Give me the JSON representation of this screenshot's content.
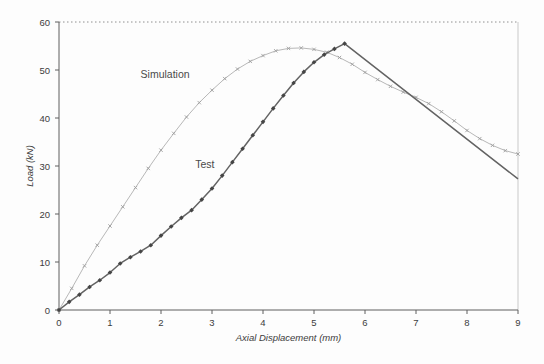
{
  "chart_data": {
    "type": "line",
    "title": "",
    "xlabel": "Axial Displacement (mm)",
    "ylabel": "Load (kN)",
    "xlim": [
      0,
      9
    ],
    "ylim": [
      0,
      60
    ],
    "xticks": [
      0,
      1,
      2,
      3,
      4,
      5,
      6,
      7,
      8,
      9
    ],
    "yticks": [
      0,
      10,
      20,
      30,
      40,
      50,
      60
    ],
    "grid": "single dotted gridline at y=60 (top frame); light solid right frame border",
    "legend_position": "none (inline text annotations)",
    "colors": {
      "axis": "#5f5f5f",
      "tick_text": "#3c3c3c",
      "top_gridline": "#909090",
      "right_border": "#c9c9c9",
      "simulation_line": "#b8b8b8",
      "simulation_marker": "#9e9e9e",
      "test_line": "#636363",
      "test_marker": "#454545",
      "annotation_text": "#4a4a4a"
    },
    "series": [
      {
        "name": "Simulation",
        "marker": "x",
        "markers_through_x": 9,
        "x": [
          0,
          0.25,
          0.5,
          0.75,
          1,
          1.25,
          1.5,
          1.75,
          2,
          2.25,
          2.5,
          2.75,
          3,
          3.25,
          3.5,
          3.75,
          4,
          4.25,
          4.5,
          4.75,
          5,
          5.25,
          5.5,
          5.75,
          6,
          6.25,
          6.5,
          6.75,
          7,
          7.25,
          7.5,
          7.75,
          8,
          8.25,
          8.5,
          8.75,
          9
        ],
        "y": [
          0,
          4.5,
          9.2,
          13.5,
          17.5,
          21.5,
          25.5,
          29.5,
          33.3,
          36.8,
          40.2,
          43.2,
          45.8,
          48.2,
          50.2,
          51.8,
          53,
          54,
          54.5,
          54.6,
          54.3,
          53.7,
          52.6,
          51.2,
          49.5,
          48,
          46.6,
          45.4,
          44.3,
          43,
          41.3,
          39.4,
          37.4,
          35.7,
          34.3,
          33.2,
          32.5
        ]
      },
      {
        "name": "Test",
        "marker": "diamond",
        "markers_through_x": 5.65,
        "x": [
          0,
          0.2,
          0.4,
          0.6,
          0.8,
          1,
          1.2,
          1.4,
          1.6,
          1.8,
          2,
          2.2,
          2.4,
          2.6,
          2.8,
          3,
          3.2,
          3.4,
          3.6,
          3.8,
          4,
          4.2,
          4.4,
          4.6,
          4.8,
          5,
          5.2,
          5.4,
          5.6,
          9
        ],
        "y": [
          0,
          1.7,
          3.2,
          4.8,
          6.2,
          7.8,
          9.7,
          11,
          12.2,
          13.5,
          15.5,
          17.4,
          19.2,
          20.8,
          23,
          25.3,
          28,
          30.8,
          33.6,
          36.4,
          39.2,
          42,
          44.7,
          47.3,
          49.6,
          51.6,
          53.2,
          54.4,
          55.5,
          27.3
        ]
      }
    ],
    "annotations": [
      {
        "text": "Simulation",
        "x": 2.08,
        "y": 48.3
      },
      {
        "text": "Test",
        "x": 2.86,
        "y": 29.5
      }
    ]
  }
}
